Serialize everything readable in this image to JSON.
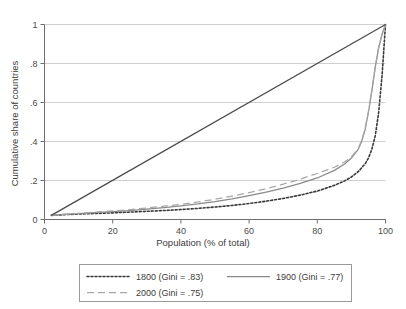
{
  "chart_data": {
    "type": "line",
    "title": "",
    "xlabel": "Population (% of total)",
    "ylabel": "Cumulative share of countries",
    "xlim": [
      0,
      100
    ],
    "ylim": [
      0,
      1
    ],
    "xticks": [
      "0",
      "20",
      "40",
      "60",
      "80",
      "100"
    ],
    "xtick_values": [
      0,
      20,
      40,
      60,
      80,
      100
    ],
    "yticks": [
      "0",
      ".2",
      ".4",
      ".6",
      ".8",
      "1"
    ],
    "ytick_values": [
      0,
      0.2,
      0.4,
      0.6,
      0.8,
      1
    ],
    "grid": "horizontal",
    "legend_position": "below",
    "series": [
      {
        "name": "1800 (Gini = .83)",
        "style": "dotted",
        "color": "#3a3a3a",
        "x": [
          2,
          5,
          10,
          15,
          20,
          25,
          30,
          35,
          40,
          45,
          50,
          55,
          60,
          65,
          70,
          75,
          80,
          85,
          88,
          90,
          92,
          94,
          95,
          96,
          97,
          98,
          99,
          100
        ],
        "y": [
          0.021,
          0.024,
          0.028,
          0.031,
          0.034,
          0.038,
          0.042,
          0.046,
          0.051,
          0.057,
          0.064,
          0.072,
          0.082,
          0.094,
          0.108,
          0.125,
          0.146,
          0.175,
          0.198,
          0.218,
          0.245,
          0.285,
          0.315,
          0.36,
          0.43,
          0.55,
          0.74,
          1.0
        ]
      },
      {
        "name": "1900 (Gini = .77)",
        "style": "solid",
        "color": "#8a8a8a",
        "x": [
          2,
          5,
          10,
          15,
          20,
          25,
          30,
          35,
          40,
          45,
          50,
          55,
          60,
          65,
          70,
          75,
          80,
          85,
          88,
          90,
          92,
          93,
          94,
          95,
          96,
          97,
          98,
          99,
          100
        ],
        "y": [
          0.021,
          0.025,
          0.03,
          0.035,
          0.04,
          0.046,
          0.053,
          0.061,
          0.07,
          0.08,
          0.092,
          0.106,
          0.122,
          0.14,
          0.161,
          0.185,
          0.213,
          0.252,
          0.285,
          0.315,
          0.36,
          0.4,
          0.46,
          0.55,
          0.66,
          0.78,
          0.88,
          0.95,
          1.0
        ]
      },
      {
        "name": "2000 (Gini = .75)",
        "style": "dashed",
        "color": "#a8a8a8",
        "x": [
          2,
          5,
          10,
          15,
          20,
          25,
          30,
          35,
          40,
          45,
          50,
          55,
          60,
          65,
          70,
          75,
          80,
          85,
          88,
          90,
          92,
          93,
          94,
          95,
          96,
          97,
          98,
          99,
          100
        ],
        "y": [
          0.021,
          0.026,
          0.032,
          0.038,
          0.044,
          0.051,
          0.059,
          0.068,
          0.078,
          0.09,
          0.104,
          0.12,
          0.138,
          0.158,
          0.181,
          0.207,
          0.236,
          0.268,
          0.295,
          0.32,
          0.365,
          0.405,
          0.465,
          0.555,
          0.665,
          0.785,
          0.885,
          0.952,
          1.0
        ]
      },
      {
        "name": "line-of-equality",
        "style": "solid",
        "color": "#4a4a4a",
        "x": [
          2,
          100
        ],
        "y": [
          0.021,
          1.0
        ]
      }
    ]
  },
  "legend": {
    "entries": [
      {
        "label": "1800 (Gini = .83)",
        "style": "dotted"
      },
      {
        "label": "1900 (Gini = .77)",
        "style": "solid"
      },
      {
        "label": "2000 (Gini = .75)",
        "style": "dashed"
      }
    ]
  },
  "colors": {
    "grid": "#cfcfcf",
    "axis": "#6e6e6e",
    "text": "#3c3c3c",
    "legend_border": "#9a9a9a",
    "background": "#ffffff"
  }
}
